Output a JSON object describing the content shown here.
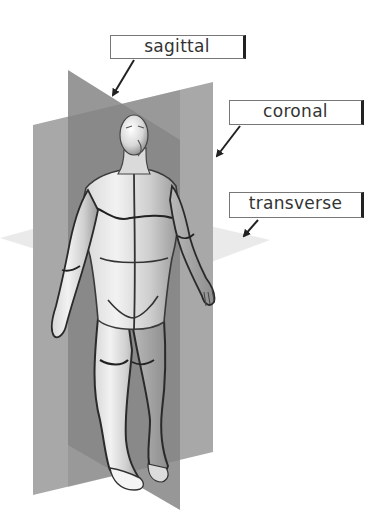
{
  "diagram": {
    "colors": {
      "background": "#ffffff",
      "coronal_plane": "#a8a8a8",
      "sagittal_plane": "#8c8c8c",
      "overlap": "#7a7a7a",
      "transverse_plane": "#e4e4e4",
      "body_skin": "#e8e8e8",
      "outline": "#2a2a2a",
      "label_border": "#777777",
      "label_text": "#333333"
    },
    "labels": [
      {
        "id": "sagittal",
        "text": "sagittal",
        "arrow_target": "sagittal plane top edge"
      },
      {
        "id": "coronal",
        "text": "coronal",
        "arrow_target": "coronal plane right edge"
      },
      {
        "id": "transverse",
        "text": "transverse",
        "arrow_target": "transverse plane right tip"
      }
    ]
  }
}
